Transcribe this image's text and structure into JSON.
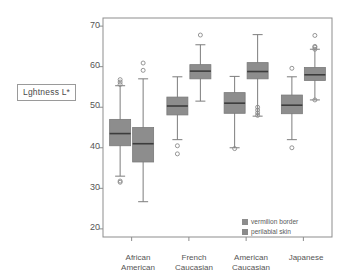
{
  "chart_data": {
    "type": "box",
    "title": "",
    "xlabel": "",
    "ylabel": "Lghtness L*",
    "ylim": [
      18,
      72
    ],
    "yticks": [
      20,
      30,
      40,
      50,
      60,
      70
    ],
    "grid": false,
    "legend_position": "inside-bottom-right",
    "categories": [
      "African\nAmerican",
      "French\nCaucasian",
      "American\nCaucasian",
      "Japanese"
    ],
    "legend": [
      {
        "name": "vermilion border",
        "color": "#8d8d8d"
      },
      {
        "name": "perilabial skin",
        "color": "#8a8a8a"
      }
    ],
    "series": [
      {
        "name": "vermilion border",
        "boxes": [
          {
            "category": "African American",
            "whisker_low": 33.0,
            "q1": 40.5,
            "median": 43.5,
            "q3": 47.0,
            "whisker_high": 55.3,
            "outliers": [
              31.5,
              31.8,
              55.6,
              56.2,
              56.8
            ]
          },
          {
            "category": "French Caucasian",
            "whisker_low": 42.0,
            "q1": 48.1,
            "median": 50.3,
            "q3": 52.5,
            "whisker_high": 57.5,
            "outliers": [
              38.5,
              40.5
            ]
          },
          {
            "category": "American Caucasian",
            "whisker_low": 40.0,
            "q1": 48.5,
            "median": 51.0,
            "q3": 53.6,
            "whisker_high": 57.6,
            "outliers": [
              39.8
            ]
          },
          {
            "category": "Japanese",
            "whisker_low": 42.0,
            "q1": 48.4,
            "median": 50.5,
            "q3": 53.0,
            "whisker_high": 57.5,
            "outliers": [
              40.0,
              59.6
            ]
          }
        ]
      },
      {
        "name": "perilabial skin",
        "boxes": [
          {
            "category": "African American",
            "whisker_low": 26.7,
            "q1": 36.5,
            "median": 41.0,
            "q3": 45.0,
            "whisker_high": 57.0,
            "outliers": [
              59.1,
              60.9
            ]
          },
          {
            "category": "French Caucasian",
            "whisker_low": 51.5,
            "q1": 57.0,
            "median": 58.9,
            "q3": 60.5,
            "whisker_high": 65.4,
            "outliers": [
              67.8
            ]
          },
          {
            "category": "American Caucasian",
            "whisker_low": 47.8,
            "q1": 57.0,
            "median": 58.8,
            "q3": 61.0,
            "whisker_high": 67.9,
            "outliers": [
              48.0,
              48.6,
              49.3,
              50.0
            ]
          },
          {
            "category": "Japanese",
            "whisker_low": 51.8,
            "q1": 56.6,
            "median": 58.0,
            "q3": 59.8,
            "whisker_high": 64.3,
            "outliers": [
              51.8,
              64.3,
              64.8,
              65.0,
              67.7
            ]
          }
        ]
      }
    ]
  },
  "axis": {
    "y_label_text": "Lghtness L*",
    "tick_20": "20",
    "tick_30": "30",
    "tick_40": "40",
    "tick_50": "50",
    "tick_60": "60",
    "tick_70": "70",
    "x_african": "African\nAmerican",
    "x_french": "French\nCaucasian",
    "x_american": "American\nCaucasian",
    "x_japanese": "Japanese"
  },
  "legend": {
    "item_1": "vermilion border",
    "item_2": "perilabial skin"
  },
  "colors": {
    "box_fill": "#8d8d8d",
    "box_edge": "#7a7a7a",
    "median": "#3c3c3c",
    "whisker": "#7d7d7d",
    "frame": "#8d8d8d",
    "text": "#555555"
  }
}
